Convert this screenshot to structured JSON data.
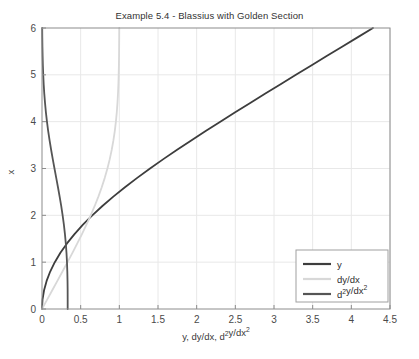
{
  "figure": {
    "title": "Example 5.4 - Blassius with Golden Section",
    "background": "#ffffff",
    "width": 419,
    "height": 359
  },
  "axes": {
    "xlabel_parts": {
      "p1": "y, dy/dx, d",
      "sup1": "2",
      "p2": "y/dx",
      "sup2": "2"
    },
    "xlabel": "y, dy/dx, d2y/dx2",
    "ylabel": "x",
    "xticks": [
      "0",
      "0.5",
      "1",
      "1.5",
      "2",
      "2.5",
      "3",
      "3.5",
      "4",
      "4.5"
    ],
    "yticks": [
      "0",
      "1",
      "2",
      "3",
      "4",
      "5",
      "6"
    ],
    "xlim": [
      0,
      4.5
    ],
    "ylim": [
      0,
      6
    ],
    "grid": true,
    "grid_color": "#e8e8e8",
    "axis_color": "#8c8c8c"
  },
  "legend": {
    "position": "lower-right",
    "border_color": "#a0a0a0",
    "entries": [
      {
        "label": "y",
        "label_parts": {
          "p1": "y",
          "sup1": "",
          "p2": "",
          "sup2": ""
        },
        "color": "#3d3d3d"
      },
      {
        "label": "dy/dx",
        "label_parts": {
          "p1": "dy/dx",
          "sup1": "",
          "p2": "",
          "sup2": ""
        },
        "color": "#d8d8d8"
      },
      {
        "label": "d2y/dx2",
        "label_parts": {
          "p1": "d",
          "sup1": "2",
          "p2": "y/dx",
          "sup2": "2"
        },
        "color": "#555555"
      }
    ]
  },
  "chart_data": {
    "type": "line",
    "title": "Example 5.4 - Blassius with Golden Section",
    "xlabel": "y, dy/dx, d2y/dx2",
    "ylabel": "x",
    "xlim": [
      0,
      4.5
    ],
    "ylim": [
      0,
      6
    ],
    "grid": true,
    "legend_position": "lower right",
    "note": "Blasius boundary-layer solution: independent variable eta plotted on the vertical (x) axis; f, f', f'' plotted horizontally.",
    "series": [
      {
        "name": "y",
        "color": "#3d3d3d",
        "width": 1.8,
        "eta": [
          0.0,
          0.2,
          0.4,
          0.6,
          0.8,
          1.0,
          1.2,
          1.4,
          1.6,
          1.8,
          2.0,
          2.2,
          2.4,
          2.6,
          2.8,
          3.0,
          3.2,
          3.4,
          3.6,
          3.8,
          4.0,
          4.2,
          4.4,
          4.6,
          4.8,
          5.0,
          5.2,
          5.4,
          5.6,
          5.8,
          6.0
        ],
        "values": [
          0.0,
          0.0066,
          0.0266,
          0.0597,
          0.1061,
          0.1656,
          0.2379,
          0.323,
          0.4203,
          0.5295,
          0.65,
          0.7812,
          0.9223,
          1.0725,
          1.231,
          1.3968,
          1.5691,
          1.747,
          1.9295,
          2.1161,
          2.3057,
          2.4981,
          2.6924,
          2.8882,
          3.0853,
          3.2833,
          3.4819,
          3.6809,
          3.8803,
          4.0799,
          4.2796
        ]
      },
      {
        "name": "dy/dx",
        "color": "#d8d8d8",
        "width": 1.8,
        "eta": [
          0.0,
          0.2,
          0.4,
          0.6,
          0.8,
          1.0,
          1.2,
          1.4,
          1.6,
          1.8,
          2.0,
          2.2,
          2.4,
          2.6,
          2.8,
          3.0,
          3.2,
          3.4,
          3.6,
          3.8,
          4.0,
          4.2,
          4.4,
          4.6,
          4.8,
          5.0,
          5.2,
          5.4,
          5.6,
          5.8,
          6.0
        ],
        "values": [
          0.0,
          0.0664,
          0.1328,
          0.1989,
          0.2647,
          0.3298,
          0.3938,
          0.4563,
          0.5168,
          0.5748,
          0.6298,
          0.6813,
          0.729,
          0.7725,
          0.8115,
          0.8461,
          0.8761,
          0.9018,
          0.9233,
          0.9411,
          0.9555,
          0.967,
          0.9759,
          0.9827,
          0.9878,
          0.9916,
          0.9943,
          0.9962,
          0.9975,
          0.9984,
          0.999
        ]
      },
      {
        "name": "d2y/dx2",
        "color": "#555555",
        "width": 1.8,
        "eta": [
          0.0,
          0.2,
          0.4,
          0.6,
          0.8,
          1.0,
          1.2,
          1.4,
          1.6,
          1.8,
          2.0,
          2.2,
          2.4,
          2.6,
          2.8,
          3.0,
          3.2,
          3.4,
          3.6,
          3.8,
          4.0,
          4.2,
          4.4,
          4.6,
          4.8,
          5.0,
          5.2,
          5.4,
          5.6,
          5.8,
          6.0
        ],
        "values": [
          0.3321,
          0.332,
          0.3315,
          0.3301,
          0.3274,
          0.323,
          0.3166,
          0.3079,
          0.2967,
          0.2829,
          0.2668,
          0.2484,
          0.2281,
          0.2065,
          0.184,
          0.1614,
          0.1391,
          0.1179,
          0.0981,
          0.0801,
          0.0642,
          0.0505,
          0.039,
          0.0295,
          0.0219,
          0.0159,
          0.0113,
          0.0079,
          0.0054,
          0.0036,
          0.0024
        ]
      }
    ]
  }
}
